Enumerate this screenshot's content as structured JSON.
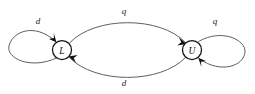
{
  "diagram": {
    "type": "state-transition-diagram",
    "background_color": "#ffffff",
    "edge_color": "#4d4d4d",
    "node_stroke_color": "#111111",
    "label_color": "#222222",
    "states": [
      {
        "id": "L",
        "label": "L",
        "cx": 62,
        "cy": 50,
        "r": 9.5
      },
      {
        "id": "U",
        "label": "U",
        "cx": 192,
        "cy": 50,
        "r": 9.5
      }
    ],
    "transitions": [
      {
        "id": "self-L",
        "from": "L",
        "to": "L",
        "label": "d",
        "label_x": 38,
        "label_y": 21,
        "kind": "self-loop-left"
      },
      {
        "id": "self-U",
        "from": "U",
        "to": "U",
        "label": "q",
        "label_x": 215,
        "label_y": 21,
        "kind": "self-loop-right"
      },
      {
        "id": "L-to-U",
        "from": "L",
        "to": "U",
        "label": "q",
        "label_x": 124,
        "label_y": 11,
        "kind": "arc-top"
      },
      {
        "id": "U-to-L",
        "from": "U",
        "to": "L",
        "label": "d",
        "label_x": 124,
        "label_y": 83,
        "kind": "arc-bottom"
      }
    ]
  }
}
